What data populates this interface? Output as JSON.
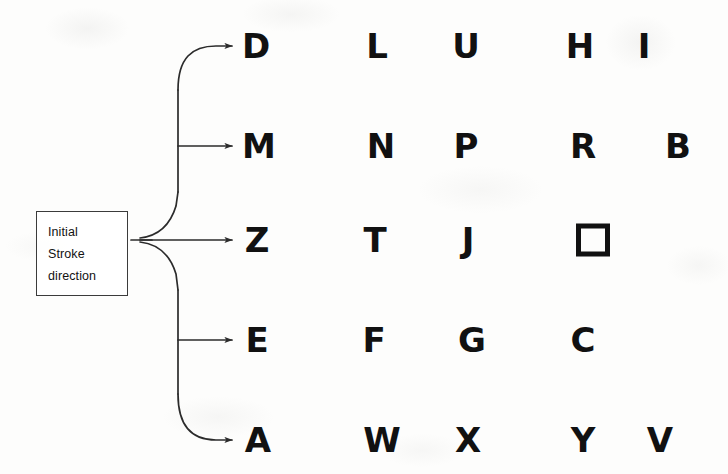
{
  "figure": {
    "background_color": "#fdfdfc",
    "ink_color": "#111111"
  },
  "source_box": {
    "name": "initial-stroke-direction-box",
    "lines": [
      "Initial",
      "Stroke",
      "direction"
    ],
    "border_color": "#3b3b3b",
    "x": 36,
    "y": 211,
    "width": 92,
    "height": 85
  },
  "connector": {
    "name": "branching-arrow-connector",
    "description": "fan-out from box to five rows, each ending in an arrowhead",
    "junction_x": 131,
    "junction_y": 240,
    "trunk_x": 178,
    "arrow_tip_x": 236,
    "rows_y": [
      46,
      146,
      240,
      340,
      440
    ],
    "stroke_color": "#2b2b2b"
  },
  "rows": [
    {
      "index": 1,
      "name": "stroke-row-1",
      "arrow_y": 46,
      "letters": [
        {
          "char": "D",
          "x": 256,
          "name": "letter-d"
        },
        {
          "char": "L",
          "x": 377,
          "name": "letter-l"
        },
        {
          "char": "U",
          "x": 466,
          "name": "letter-u"
        },
        {
          "char": "H",
          "x": 580,
          "name": "letter-h"
        },
        {
          "char": "I",
          "x": 644,
          "name": "letter-i"
        }
      ]
    },
    {
      "index": 2,
      "name": "stroke-row-2",
      "arrow_y": 146,
      "letters": [
        {
          "char": "M",
          "x": 259,
          "name": "letter-m"
        },
        {
          "char": "N",
          "x": 381,
          "name": "letter-n"
        },
        {
          "char": "P",
          "x": 466,
          "name": "letter-p"
        },
        {
          "char": "R",
          "x": 583,
          "name": "letter-r"
        },
        {
          "char": "B",
          "x": 678,
          "name": "letter-b"
        }
      ]
    },
    {
      "index": 3,
      "name": "stroke-row-3",
      "arrow_y": 240,
      "letters": [
        {
          "char": "Z",
          "x": 257,
          "name": "letter-z"
        },
        {
          "char": "T",
          "x": 375,
          "name": "letter-t"
        },
        {
          "char": "J",
          "x": 468,
          "name": "letter-j"
        },
        {
          "char": "□",
          "x": 593,
          "name": "shape-square"
        }
      ]
    },
    {
      "index": 4,
      "name": "stroke-row-4",
      "arrow_y": 340,
      "letters": [
        {
          "char": "E",
          "x": 257,
          "name": "letter-e"
        },
        {
          "char": "F",
          "x": 374,
          "name": "letter-f"
        },
        {
          "char": "G",
          "x": 472,
          "name": "letter-g"
        },
        {
          "char": "C",
          "x": 583,
          "name": "letter-c"
        }
      ]
    },
    {
      "index": 5,
      "name": "stroke-row-5",
      "arrow_y": 440,
      "letters": [
        {
          "char": "A",
          "x": 258,
          "name": "letter-a"
        },
        {
          "char": "W",
          "x": 382,
          "name": "letter-w"
        },
        {
          "char": "X",
          "x": 468,
          "name": "letter-x"
        },
        {
          "char": "Y",
          "x": 583,
          "name": "letter-y"
        },
        {
          "char": "V",
          "x": 660,
          "name": "letter-v"
        }
      ]
    }
  ]
}
